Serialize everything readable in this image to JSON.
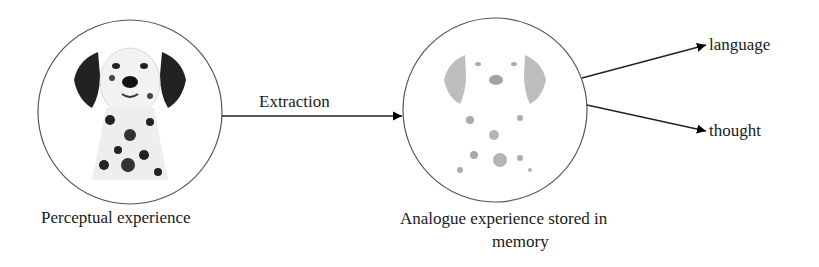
{
  "diagram": {
    "nodes": [
      {
        "id": "perceptual",
        "image": "dalmatian-photo",
        "caption": "Perceptual experience"
      },
      {
        "id": "analogue",
        "image": "dalmatian-faded-photo",
        "caption_line1": "Analogue experience stored in",
        "caption_line2": "memory"
      }
    ],
    "edges": [
      {
        "from": "perceptual",
        "to": "analogue",
        "label": "Extraction"
      },
      {
        "from": "analogue",
        "to": "language",
        "label": "language"
      },
      {
        "from": "analogue",
        "to": "thought",
        "label": "thought"
      }
    ],
    "colors": {
      "stroke": "#333333",
      "text": "#1a1a1a"
    }
  }
}
